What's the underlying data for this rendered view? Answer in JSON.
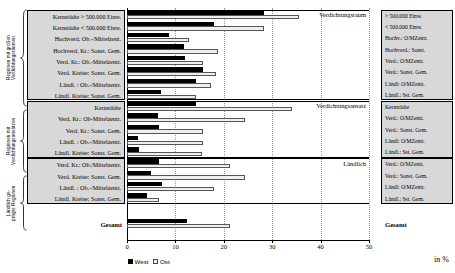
{
  "axis": {
    "ticks": [
      0,
      10,
      20,
      30,
      40,
      50
    ],
    "unit_label": "in %",
    "xmin": 0,
    "xmax": 50
  },
  "legend": {
    "west_label": "West",
    "ost_label": "Ost",
    "position": "bottom-left"
  },
  "groups": [
    {
      "caption": "Regionen mit großen\nVerdichtungsräumen",
      "block_label": "Verdichtungsraum"
    },
    {
      "caption": "Regionen mit\nVerdichtungsansätzen",
      "block_label": "Verdichtungsansatz"
    },
    {
      "caption": "Ländlich ge-\nprägte Regionen",
      "block_label": "Ländlich"
    }
  ],
  "total": {
    "left_label": "Gesamt",
    "right_label": "Gesamt"
  },
  "chart_data": {
    "type": "bar",
    "orientation": "horizontal",
    "title": "",
    "xlabel": "in %",
    "ylabel": "",
    "xlim": [
      0,
      50
    ],
    "grid": true,
    "legend_position": "bottom-left",
    "series": [
      {
        "name": "West",
        "color": "#000000"
      },
      {
        "name": "Ost",
        "color": "#efefef"
      }
    ],
    "blocks": [
      {
        "block_label": "Verdichtungsraum",
        "group_caption": "Regionen mit großen Verdichtungsräumen",
        "categories": [
          "Kernstädte > 500.000 Einw.",
          "Kernstädte < 500.000 Einw.",
          "Hochverd. Ob.-/Mittelzent.",
          "Hochverd. Kr.: Sonst. Gem.",
          "Verd. Kr.: Ob.-Mittelzentr.",
          "Verd. Kreise: Sonst. Gem.",
          "Ländl. : Ob.-/Mittelzentr.",
          "Ländl. Kreise: Sonst. Gem."
        ],
        "categories_right": [
          "> 500.000 Einw.",
          "< 500.000 Einw.",
          "Hochv.: O/MZentr.",
          "Hochverd.: Sonst.",
          "Verd.: O/MZentr.",
          "Verd.: Sonst. Gem.",
          "Ländl: O/MZentr.",
          "Ländl.: Sst. Gem."
        ],
        "west": [
          28.4,
          18.0,
          8.7,
          11.8,
          12.0,
          15.8,
          14.3,
          7.0
        ],
        "ost": [
          35.5,
          28.4,
          12.9,
          18.7,
          15.8,
          18.3,
          17.4,
          14.3
        ]
      },
      {
        "block_label": "Verdichtungsansatz",
        "group_caption": "Regionen mit Verdichtungsansätzen",
        "categories": [
          "Kernstädte",
          "Verd. Kr.: Ob-Mittelzentr.",
          "Verd. Kr.: Sonst. Gem.",
          "Ländl. : Ob.-/Mittelzentr.",
          "Ländl. Kreise: Sonst. Gem."
        ],
        "categories_right": [
          "Kernstädte",
          "Verd.: O/MZentr.",
          "Verd.: Sonst. Gem.",
          "Ländl: O/MZentr.",
          "Ländl.: Sst. Gem."
        ],
        "west": [
          14.3,
          6.4,
          6.6,
          2.3,
          2.5
        ],
        "ost": [
          34.0,
          24.3,
          15.8,
          15.6,
          15.4
        ]
      },
      {
        "block_label": "Ländlich",
        "group_caption": "Ländlich geprägte Regionen",
        "categories": [
          "Verd. Kr.: Ob./Mittelzentr.",
          "Verd. Kreise: Sonst. Gem.",
          "Ländl. : Ob.-/Mittelzentr.",
          "Ländl. Kreise: Sonst. Gem."
        ],
        "categories_right": [
          "Verd.: O/MZentr.",
          "Verd.: Sonst. Gem.",
          "Ländl: O/MZentr.",
          "Ländl.: Sst. Gem."
        ],
        "west": [
          6.6,
          5.0,
          7.3,
          4.1
        ],
        "ost": [
          21.2,
          24.3,
          18.0,
          6.6
        ]
      }
    ],
    "total_row": {
      "label": "Gesamt",
      "west": 12.4,
      "ost": 21.2
    }
  }
}
